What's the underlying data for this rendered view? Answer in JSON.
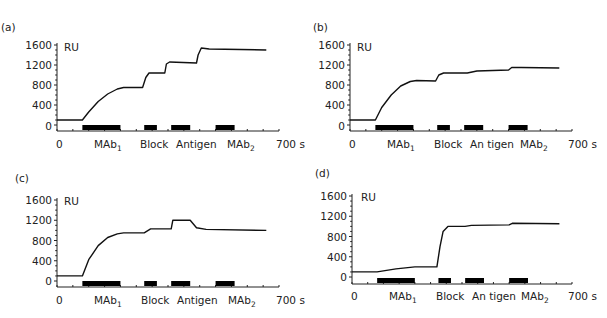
{
  "chart_data": [
    {
      "panel": "(a)",
      "type": "line",
      "xlabel_end": "700 s",
      "ylabel": "RU",
      "x_range": [
        0,
        700
      ],
      "ylim": [
        0,
        1600
      ],
      "yticks": [
        "1600",
        "1200",
        "800",
        "400",
        "0"
      ],
      "x_start_label": "0",
      "injection_labels": [
        "MAb1",
        "Block",
        "Antigen",
        "MAb2"
      ],
      "injections": [
        [
          80,
          200
        ],
        [
          275,
          315
        ],
        [
          360,
          420
        ],
        [
          500,
          560
        ]
      ],
      "series": [
        {
          "name": "sensorgram",
          "points": [
            [
              0,
              100
            ],
            [
              80,
              100
            ],
            [
              100,
              260
            ],
            [
              130,
              470
            ],
            [
              160,
              620
            ],
            [
              190,
              720
            ],
            [
              210,
              750
            ],
            [
              270,
              750
            ],
            [
              280,
              950
            ],
            [
              290,
              1040
            ],
            [
              340,
              1040
            ],
            [
              345,
              1220
            ],
            [
              355,
              1260
            ],
            [
              440,
              1240
            ],
            [
              445,
              1400
            ],
            [
              455,
              1540
            ],
            [
              480,
              1520
            ],
            [
              660,
              1500
            ]
          ]
        }
      ]
    },
    {
      "panel": "(b)",
      "type": "line",
      "xlabel_end": "700 s",
      "ylabel": "RU",
      "x_range": [
        0,
        700
      ],
      "ylim": [
        0,
        1600
      ],
      "yticks": [
        "1600",
        "1200",
        "800",
        "400",
        "0"
      ],
      "x_start_label": "0",
      "injection_labels": [
        "MAb1",
        "Block",
        "An tigen",
        "MAb2"
      ],
      "injections": [
        [
          80,
          200
        ],
        [
          275,
          315
        ],
        [
          360,
          420
        ],
        [
          500,
          560
        ]
      ],
      "series": [
        {
          "name": "sensorgram",
          "points": [
            [
              0,
              100
            ],
            [
              80,
              100
            ],
            [
              100,
              350
            ],
            [
              130,
              600
            ],
            [
              160,
              780
            ],
            [
              190,
              870
            ],
            [
              210,
              890
            ],
            [
              270,
              880
            ],
            [
              280,
              1000
            ],
            [
              295,
              1040
            ],
            [
              370,
              1040
            ],
            [
              400,
              1080
            ],
            [
              500,
              1100
            ],
            [
              510,
              1150
            ],
            [
              540,
              1150
            ],
            [
              660,
              1140
            ]
          ]
        }
      ]
    },
    {
      "panel": "(c)",
      "type": "line",
      "xlabel_end": "700 s",
      "ylabel": "RU",
      "x_range": [
        0,
        700
      ],
      "ylim": [
        0,
        1600
      ],
      "yticks": [
        "1600",
        "1200",
        "800",
        "400",
        "0"
      ],
      "x_start_label": "0",
      "injection_labels": [
        "MAb1",
        "Block",
        "Antigen",
        "MAb2"
      ],
      "injections": [
        [
          80,
          200
        ],
        [
          275,
          315
        ],
        [
          360,
          420
        ],
        [
          500,
          560
        ]
      ],
      "series": [
        {
          "name": "sensorgram",
          "points": [
            [
              0,
              100
            ],
            [
              80,
              100
            ],
            [
              100,
              420
            ],
            [
              130,
              700
            ],
            [
              160,
              860
            ],
            [
              190,
              930
            ],
            [
              210,
              950
            ],
            [
              275,
              950
            ],
            [
              295,
              1030
            ],
            [
              360,
              1030
            ],
            [
              365,
              1200
            ],
            [
              420,
              1200
            ],
            [
              440,
              1050
            ],
            [
              470,
              1020
            ],
            [
              660,
              1000
            ]
          ]
        }
      ]
    },
    {
      "panel": "(d)",
      "type": "line",
      "xlabel_end": "700 s",
      "ylabel": "RU",
      "x_range": [
        0,
        700
      ],
      "ylim": [
        0,
        1600
      ],
      "yticks": [
        "1600",
        "1200",
        "800",
        "400",
        "0"
      ],
      "x_start_label": "0",
      "injection_labels": [
        "MAb1",
        "Block",
        "An tigen",
        "MAb2"
      ],
      "injections": [
        [
          80,
          200
        ],
        [
          275,
          315
        ],
        [
          360,
          420
        ],
        [
          500,
          560
        ]
      ],
      "series": [
        {
          "name": "sensorgram",
          "points": [
            [
              0,
              100
            ],
            [
              80,
              100
            ],
            [
              140,
              160
            ],
            [
              200,
              200
            ],
            [
              270,
              200
            ],
            [
              280,
              600
            ],
            [
              290,
              900
            ],
            [
              305,
              1000
            ],
            [
              360,
              1000
            ],
            [
              380,
              1020
            ],
            [
              500,
              1030
            ],
            [
              510,
              1060
            ],
            [
              660,
              1050
            ]
          ]
        }
      ]
    }
  ],
  "panels": {
    "a": {
      "label": "(a)",
      "unit": "RU",
      "y": [
        "1600",
        "1200",
        "800",
        "400",
        "0"
      ],
      "x0": "0",
      "xend": "700 s",
      "inj": [
        "MAb",
        "Block",
        "Antigen",
        "MAb"
      ],
      "sub": [
        "1",
        "2"
      ]
    },
    "b": {
      "label": "(b)",
      "unit": "RU",
      "y": [
        "1600",
        "1200",
        "800",
        "400",
        "0"
      ],
      "x0": "0",
      "xend": "700 s",
      "inj": [
        "MAb",
        "Block",
        "An tigen",
        "MAb"
      ],
      "sub": [
        "1",
        "2"
      ]
    },
    "c": {
      "label": "(c)",
      "unit": "RU",
      "y": [
        "1600",
        "1200",
        "800",
        "400",
        "0"
      ],
      "x0": "0",
      "xend": "700 s",
      "inj": [
        "MAb",
        "Block",
        "Antigen",
        "MAb"
      ],
      "sub": [
        "1",
        "2"
      ]
    },
    "d": {
      "label": "(d)",
      "unit": "RU",
      "y": [
        "1600",
        "1200",
        "800",
        "400",
        "0"
      ],
      "x0": "0",
      "xend": "700 s",
      "inj": [
        "MAb",
        "Block",
        "An tigen",
        "MAb"
      ],
      "sub": [
        "1",
        "2"
      ]
    }
  }
}
